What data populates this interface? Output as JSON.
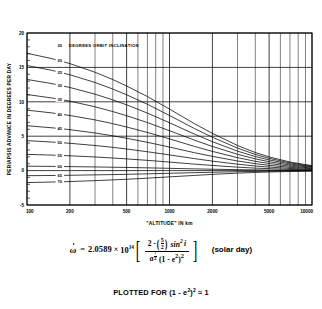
{
  "figure": {
    "caption": "PLOTTED FOR (1 - e²)² ≈ 1",
    "caption_prefix": "PLOTTED FOR (1 - e",
    "caption_mid": ")",
    "caption_suffix": " ≈ 1"
  },
  "equation": {
    "lhs": "ω",
    "equals": "=",
    "coefficient": "2.0589",
    "times": "×",
    "base": "10",
    "exponent": "14",
    "numerator_lead": "2 -",
    "numerator_frac_num": "5",
    "numerator_frac_den": "2",
    "numerator_sin": "sin",
    "numerator_sin_pow": "2",
    "numerator_i": "i",
    "denominator_a": "a",
    "denominator_a_num": "7",
    "denominator_a_den": "2",
    "denominator_rest_open": "(1 - e",
    "denominator_e_pow": "2",
    "denominator_rest_close": ")",
    "denominator_outer_pow": "2",
    "units": "(solar day)",
    "bracket_left": "[",
    "bracket_right": "]",
    "paren_left": "(",
    "paren_right": ")"
  },
  "chart_data": {
    "type": "line",
    "title": "",
    "xlabel": "\"ALTITUDE\" IN km",
    "ylabel": "PERIAPSIS ADVANCE IN DEGREES PER DAY",
    "header_note": "DEGREES ORBIT INCLINATION",
    "header_note_value": "20",
    "xscale": "log",
    "yscale": "linear",
    "xlim": [
      100,
      10000
    ],
    "ylim": [
      -5,
      20
    ],
    "grid": true,
    "legend_position": "inline-left",
    "x_major_ticks": [
      100,
      200,
      500,
      1000,
      2000,
      5000,
      10000
    ],
    "x_major_tick_labels": [
      "100",
      "200",
      "500",
      "1000",
      "2000",
      "5000",
      "10000"
    ],
    "x_minor_ticks": [
      300,
      400,
      600,
      700,
      800,
      900,
      3000,
      4000,
      6000,
      7000,
      8000,
      9000
    ],
    "y_ticks": [
      -5,
      0,
      5,
      10,
      15,
      20
    ],
    "y_tick_labels": [
      "-5",
      "0",
      "5",
      "10",
      "15",
      "20"
    ],
    "y_minor_ticks": [
      -4,
      -3,
      -2,
      -1,
      1,
      2,
      3,
      4,
      6,
      7,
      8,
      9,
      11,
      12,
      13,
      14,
      16,
      17,
      18,
      19
    ],
    "x": [
      100,
      150,
      200,
      300,
      400,
      500,
      700,
      1000,
      1500,
      2000,
      3000,
      4000,
      5000,
      7000,
      10000
    ],
    "series": [
      {
        "name": "20",
        "label": "20",
        "inclination_deg": 20,
        "values": [
          17.05,
          16.27,
          15.55,
          14.3,
          13.23,
          12.3,
          10.76,
          8.94,
          6.81,
          5.41,
          3.65,
          2.63,
          1.99,
          1.25,
          0.72
        ]
      },
      {
        "name": "25",
        "label": "25",
        "inclination_deg": 25,
        "values": [
          15.27,
          14.57,
          13.93,
          12.81,
          11.85,
          11.02,
          9.64,
          8.01,
          6.1,
          4.85,
          3.27,
          2.35,
          1.78,
          1.12,
          0.64
        ]
      },
      {
        "name": "30",
        "label": "30",
        "inclination_deg": 30,
        "values": [
          13.25,
          12.64,
          12.08,
          11.11,
          10.28,
          9.56,
          8.36,
          6.95,
          5.29,
          4.2,
          2.83,
          2.04,
          1.55,
          0.97,
          0.56
        ]
      },
      {
        "name": "35",
        "label": "35",
        "inclination_deg": 35,
        "values": [
          11.06,
          10.55,
          10.09,
          9.28,
          8.58,
          7.98,
          6.98,
          5.8,
          4.42,
          3.51,
          2.37,
          1.71,
          1.29,
          0.81,
          0.47
        ]
      },
      {
        "name": "40",
        "label": "40",
        "inclination_deg": 40,
        "values": [
          8.79,
          8.38,
          8.01,
          7.37,
          6.82,
          6.34,
          5.54,
          4.61,
          3.51,
          2.79,
          1.88,
          1.35,
          1.03,
          0.64,
          0.37
        ]
      },
      {
        "name": "45",
        "label": "45",
        "inclination_deg": 45,
        "values": [
          6.52,
          6.22,
          5.95,
          5.47,
          5.06,
          4.7,
          4.11,
          3.42,
          2.6,
          2.07,
          1.4,
          1.01,
          0.76,
          0.48,
          0.28
        ]
      },
      {
        "name": "50",
        "label": "50",
        "inclination_deg": 50,
        "values": [
          4.35,
          4.15,
          3.97,
          3.65,
          3.38,
          3.14,
          2.74,
          2.28,
          1.74,
          1.38,
          0.93,
          0.67,
          0.51,
          0.32,
          0.18
        ]
      },
      {
        "name": "55",
        "label": "55",
        "inclination_deg": 55,
        "values": [
          2.36,
          2.25,
          2.15,
          1.98,
          1.83,
          1.7,
          1.49,
          1.24,
          0.94,
          0.75,
          0.5,
          0.36,
          0.28,
          0.17,
          0.1
        ]
      },
      {
        "name": "60",
        "label": "60",
        "inclination_deg": 60,
        "values": [
          0.64,
          0.61,
          0.58,
          0.53,
          0.49,
          0.46,
          0.4,
          0.33,
          0.25,
          0.2,
          0.14,
          0.1,
          0.07,
          0.05,
          0.03
        ]
      },
      {
        "name": "65",
        "label": "65",
        "inclination_deg": 65,
        "values": [
          -0.74,
          -0.71,
          -0.68,
          -0.62,
          -0.58,
          -0.54,
          -0.47,
          -0.39,
          -0.3,
          -0.24,
          -0.16,
          -0.11,
          -0.09,
          -0.05,
          -0.03
        ]
      },
      {
        "name": "70",
        "label": "70",
        "inclination_deg": 70,
        "values": [
          -1.74,
          -1.66,
          -1.59,
          -1.46,
          -1.35,
          -1.26,
          -1.1,
          -0.91,
          -0.7,
          -0.55,
          -0.37,
          -0.27,
          -0.2,
          -0.13,
          -0.07
        ]
      }
    ]
  }
}
